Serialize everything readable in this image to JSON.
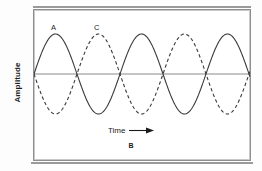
{
  "figure": {
    "caption": "B",
    "wave_tags": [
      {
        "id": "A",
        "label": "A",
        "style": "solid"
      },
      {
        "id": "C",
        "label": "C",
        "style": "dashed"
      }
    ]
  },
  "axes": {
    "y_label": "Amplitude",
    "x_label": "Time",
    "x_arrow_icon": "right-arrow-icon"
  },
  "colors": {
    "wave_solid": "#3a3a3a",
    "wave_dashed": "#3a3a3a",
    "zero_line": "#8a8a8a",
    "frame": "#8e8e8e",
    "text": "#1a1a1a",
    "background": "#ffffff"
  },
  "chart_data": {
    "type": "line",
    "title": "",
    "xlabel": "Time",
    "ylabel": "Amplitude",
    "grid": false,
    "legend": "none",
    "xlim": [
      0,
      216
    ],
    "ylim": [
      -1,
      1
    ],
    "annotations": [
      {
        "text": "A",
        "x": 22,
        "y": 1.0,
        "note": "label on first solid crest"
      },
      {
        "text": "C",
        "x": 65,
        "y": 1.0,
        "note": "label on first dashed crest"
      },
      {
        "text": "B",
        "x": 108,
        "y": -1.6,
        "note": "figure caption below axis"
      }
    ],
    "axis_zero_line_y": 0,
    "period_px": 86,
    "amplitude_px": 40,
    "cycles_visible": 2.5,
    "series": [
      {
        "name": "A",
        "style": "solid",
        "phase_deg": 0,
        "amplitude": 1,
        "period": 86,
        "description": "Solid sine wave starting at zero rising to a crest."
      },
      {
        "name": "C",
        "style": "dashed",
        "phase_deg": 180,
        "amplitude": 1,
        "period": 86,
        "description": "Dashed sine wave 180 degrees out of phase with A (destructive interference)."
      }
    ]
  }
}
